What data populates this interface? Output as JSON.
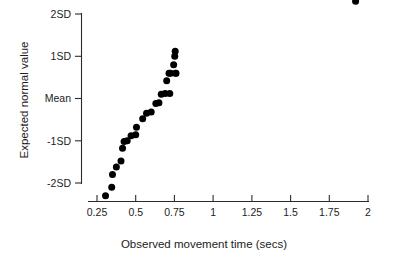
{
  "chart_data": {
    "type": "scatter",
    "title": "",
    "xlabel": "Observed movement time (secs)",
    "ylabel": "Expected normal value",
    "xlim": [
      0.22,
      2.05
    ],
    "ylim": [
      -2.45,
      2.45
    ],
    "grid": false,
    "legend": null,
    "xticks": [
      0.25,
      0.5,
      0.75,
      1,
      1.25,
      1.5,
      1.75,
      2
    ],
    "xticklabels": [
      "0.25",
      "0.5",
      "0.75",
      "1",
      "1.25",
      "1.5",
      "1.75",
      "2"
    ],
    "yticks": [
      2,
      1,
      0,
      -1,
      -2
    ],
    "yticklabels": [
      "2SD",
      "1SD",
      "Mean",
      "-1SD",
      "-2SD"
    ],
    "point_color": "#000000",
    "point_size_px": 4.6,
    "x": [
      0.305,
      0.345,
      0.35,
      0.375,
      0.405,
      0.415,
      0.425,
      0.445,
      0.47,
      0.5,
      0.505,
      0.545,
      0.57,
      0.6,
      0.63,
      0.65,
      0.665,
      0.69,
      0.7,
      0.715,
      0.72,
      0.725,
      0.745,
      0.752,
      0.755,
      0.757,
      0.76,
      1.92
    ],
    "y": [
      -2.3,
      -2.1,
      -1.8,
      -1.62,
      -1.48,
      -1.18,
      -1.02,
      -1.0,
      -0.88,
      -0.86,
      -0.68,
      -0.48,
      -0.35,
      -0.32,
      -0.12,
      -0.1,
      0.1,
      0.12,
      0.42,
      0.6,
      0.12,
      0.6,
      0.8,
      1.0,
      1.12,
      0.6,
      0.6,
      2.3
    ],
    "points": [
      {
        "x": 0.305,
        "y": -2.3
      },
      {
        "x": 0.345,
        "y": -2.1
      },
      {
        "x": 0.35,
        "y": -1.8
      },
      {
        "x": 0.375,
        "y": -1.62
      },
      {
        "x": 0.405,
        "y": -1.48
      },
      {
        "x": 0.415,
        "y": -1.18
      },
      {
        "x": 0.425,
        "y": -1.02
      },
      {
        "x": 0.445,
        "y": -1.0
      },
      {
        "x": 0.47,
        "y": -0.88
      },
      {
        "x": 0.5,
        "y": -0.86
      },
      {
        "x": 0.505,
        "y": -0.68
      },
      {
        "x": 0.545,
        "y": -0.48
      },
      {
        "x": 0.57,
        "y": -0.35
      },
      {
        "x": 0.6,
        "y": -0.32
      },
      {
        "x": 0.63,
        "y": -0.12
      },
      {
        "x": 0.65,
        "y": -0.1
      },
      {
        "x": 0.665,
        "y": 0.1
      },
      {
        "x": 0.69,
        "y": 0.12
      },
      {
        "x": 0.7,
        "y": 0.42
      },
      {
        "x": 0.715,
        "y": 0.6
      },
      {
        "x": 0.72,
        "y": 0.12
      },
      {
        "x": 0.725,
        "y": 0.6
      },
      {
        "x": 0.745,
        "y": 0.8
      },
      {
        "x": 0.752,
        "y": 1.0
      },
      {
        "x": 0.755,
        "y": 1.12
      },
      {
        "x": 0.757,
        "y": 0.6
      },
      {
        "x": 0.76,
        "y": 0.6
      },
      {
        "x": 1.92,
        "y": 2.3
      }
    ]
  },
  "figure": {
    "background": "#ffffff",
    "axis_color": "#2b2b2b"
  }
}
